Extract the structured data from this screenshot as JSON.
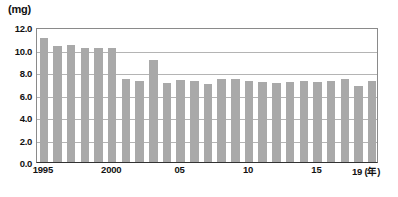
{
  "chart_data": {
    "type": "bar",
    "title": "",
    "subtitle": "",
    "unit_label": "(mg)",
    "xlabel": "(年)",
    "ylabel": "",
    "ylim": [
      0.0,
      12.0
    ],
    "ytick_step": 2.0,
    "ytick_labels": [
      "12.0",
      "10.0",
      "8.0",
      "6.0",
      "4.0",
      "2.0",
      "0.0"
    ],
    "ytick_values": [
      12.0,
      10.0,
      8.0,
      6.0,
      4.0,
      2.0,
      0.0
    ],
    "grid": true,
    "grid_axis": "y",
    "legend": "none",
    "bar_color": "#a9a9a9",
    "categories": [
      "1995",
      "1996",
      "1997",
      "1998",
      "1999",
      "2000",
      "2001",
      "2002",
      "2003",
      "2004",
      "2005",
      "2006",
      "2007",
      "2008",
      "2009",
      "2010",
      "2011",
      "2012",
      "2013",
      "2014",
      "2015",
      "2016",
      "2017",
      "2018",
      "2019"
    ],
    "xtick_labels": [
      "1995",
      "2000",
      "05",
      "10",
      "15",
      "19"
    ],
    "xtick_categories": [
      "1995",
      "2000",
      "2005",
      "2010",
      "2015",
      "2019"
    ],
    "values": [
      11.0,
      10.3,
      10.4,
      10.1,
      10.1,
      10.1,
      7.4,
      7.2,
      9.1,
      7.0,
      7.3,
      7.2,
      6.9,
      7.4,
      7.4,
      7.2,
      7.1,
      7.0,
      7.1,
      7.2,
      7.1,
      7.2,
      7.4,
      6.8,
      7.2
    ]
  },
  "axis": {
    "unit": "(mg)",
    "x_unit_suffix": "(年)"
  },
  "caption": {
    "text": ""
  }
}
